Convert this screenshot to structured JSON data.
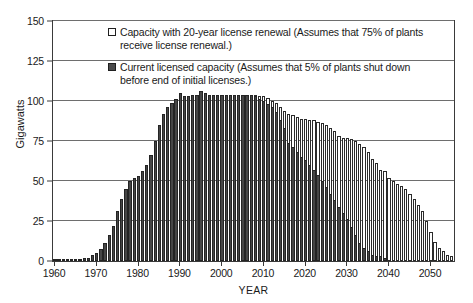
{
  "chart_data": {
    "type": "bar",
    "title": "",
    "xlabel": "YEAR",
    "ylabel": "Gigawatts",
    "ylim": [
      0,
      150
    ],
    "xlim": [
      1960,
      2055
    ],
    "y_ticks": [
      0,
      25,
      50,
      75,
      100,
      125,
      150
    ],
    "x_ticks": [
      1960,
      1970,
      1980,
      1990,
      2000,
      2010,
      2020,
      2030,
      2040,
      2050
    ],
    "grid": "horizontal",
    "legend_position": "top-center",
    "colors": {
      "renewal": "#ffffff",
      "current": "#464646",
      "outline": "#242424",
      "gridline": "#6e6e6e",
      "axis": "#3a3a3a"
    },
    "series": [
      {
        "name": "Capacity with 20-year license renewal (Assumes that 75% of plants receive license renewal.)",
        "key": "renewal",
        "style": "hollow",
        "values": [
          0.3,
          0.3,
          0.5,
          0.6,
          0.8,
          1.0,
          1.3,
          1.6,
          2.0,
          3.5,
          5.0,
          7.5,
          11.0,
          16.0,
          22.0,
          31.0,
          39.0,
          45.0,
          50.0,
          52.0,
          53.0,
          56.0,
          60.0,
          66.0,
          75.0,
          85.0,
          92.0,
          96.0,
          99.0,
          101.0,
          105.0,
          103.0,
          103.0,
          104.0,
          104.0,
          106.0,
          105.0,
          104.0,
          104.0,
          104.0,
          104.0,
          104.0,
          104.0,
          104.0,
          104.0,
          104.0,
          104.0,
          104.0,
          104.0,
          103.0,
          103.0,
          102.0,
          100.0,
          99.0,
          96.0,
          94.0,
          92.0,
          91.0,
          90.0,
          89.0,
          89.0,
          88.0,
          88.0,
          87.0,
          86.0,
          85.0,
          83.0,
          81.0,
          78.0,
          77.0,
          77.0,
          76.0,
          75.0,
          73.0,
          71.0,
          68.0,
          64.0,
          61.0,
          57.0,
          56.0,
          52.0,
          50.0,
          48.0,
          47.0,
          45.0,
          42.0,
          39.0,
          35.0,
          31.0,
          25.0,
          18.0,
          12.0,
          8.0,
          6.0,
          4.0,
          3.0,
          3.0,
          2.0
        ]
      },
      {
        "name": "Current licensed capacity (Assumes that 5% of plants shut down before end of initial licenses.)",
        "key": "current",
        "style": "filled",
        "values": [
          0.3,
          0.3,
          0.5,
          0.6,
          0.8,
          1.0,
          1.3,
          1.6,
          2.0,
          3.5,
          5.0,
          7.5,
          11.0,
          16.0,
          22.0,
          31.0,
          39.0,
          45.0,
          50.0,
          52.0,
          53.0,
          56.0,
          60.0,
          66.0,
          75.0,
          85.0,
          92.0,
          96.0,
          99.0,
          101.0,
          105.0,
          103.0,
          103.0,
          104.0,
          104.0,
          106.0,
          105.0,
          104.0,
          104.0,
          104.0,
          104.0,
          104.0,
          104.0,
          104.0,
          104.0,
          104.0,
          104.0,
          104.0,
          103.0,
          101.0,
          100.0,
          98.0,
          96.0,
          93.0,
          88.0,
          83.0,
          74.0,
          71.0,
          68.0,
          65.0,
          63.0,
          60.0,
          57.0,
          54.0,
          50.0,
          46.0,
          42.0,
          38.0,
          34.0,
          30.0,
          26.0,
          21.0,
          16.0,
          11.0,
          8.0,
          6.0,
          4.0,
          3.0,
          3.0,
          2.0,
          0,
          0,
          0,
          0,
          0,
          0,
          0,
          0,
          0,
          0,
          0,
          0,
          0,
          0,
          0,
          0,
          0,
          0
        ]
      }
    ],
    "x_start_year": 1960,
    "annotations": []
  },
  "legend": {
    "items": [
      {
        "swatch": "hollow-square",
        "line1": "Capacity with 20-year license renewal (Assumes that 75% of",
        "line2": "plants receive license renewal.)"
      },
      {
        "swatch": "filled-square",
        "line1": "Current licensed capacity (Assumes that 5% of plants shut down",
        "line2": "before end of initial licenses.)"
      }
    ]
  },
  "axes": {
    "y_title": "Gigawatts",
    "x_title": "YEAR",
    "y_tick_labels": [
      "0",
      "25",
      "50",
      "75",
      "100",
      "125",
      "150"
    ],
    "x_tick_labels": [
      "1960",
      "1970",
      "1980",
      "1990",
      "2000",
      "2010",
      "2020",
      "2030",
      "2040",
      "2050"
    ]
  }
}
